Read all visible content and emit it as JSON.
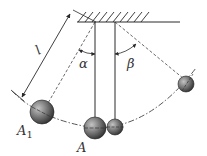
{
  "diagram": {
    "labels": {
      "length": "l",
      "alpha": "α",
      "beta": "β",
      "A1_main": "A",
      "A1_sub": "1",
      "A": "A"
    },
    "colors": {
      "line": "#2a2a2a",
      "dash": "#444444",
      "ball_light": "#b8b8b8",
      "ball_dark": "#2e2e2e",
      "text": "#333333"
    }
  }
}
